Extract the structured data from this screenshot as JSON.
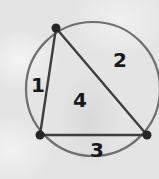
{
  "diagram": {
    "type": "circle-with-inscribed-triangle",
    "circle": {
      "cx": 93,
      "cy": 89,
      "r": 67,
      "stroke": "#6f6f6f"
    },
    "triangle": {
      "stroke": "#3e3e3e",
      "vertices": [
        {
          "name": "top",
          "x": 56,
          "y": 28
        },
        {
          "name": "bottom-left",
          "x": 40,
          "y": 135
        },
        {
          "name": "bottom-right",
          "x": 147,
          "y": 135
        }
      ]
    },
    "vertex_color": "#262626",
    "region_labels": [
      {
        "text": "1",
        "x": 38,
        "y": 92
      },
      {
        "text": "2",
        "x": 120,
        "y": 67
      },
      {
        "text": "4",
        "x": 80,
        "y": 107
      },
      {
        "text": "3",
        "x": 97,
        "y": 157
      }
    ]
  }
}
